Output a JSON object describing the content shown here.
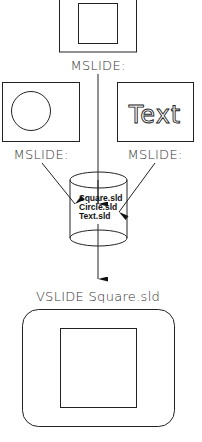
{
  "diagram": {
    "top_slide": {
      "content": "square-shape",
      "label": "MSLIDE:"
    },
    "left_slide": {
      "content": "circle-shape",
      "label": "MSLIDE:"
    },
    "right_slide": {
      "content_text": "Text",
      "label": "MSLIDE:"
    },
    "library": {
      "shape": "cylinder",
      "files": [
        "Square.sld",
        "Circle.sld",
        "Text.sld"
      ]
    },
    "output": {
      "label": "VSLIDE Square.sld",
      "content": "square-shape"
    }
  }
}
